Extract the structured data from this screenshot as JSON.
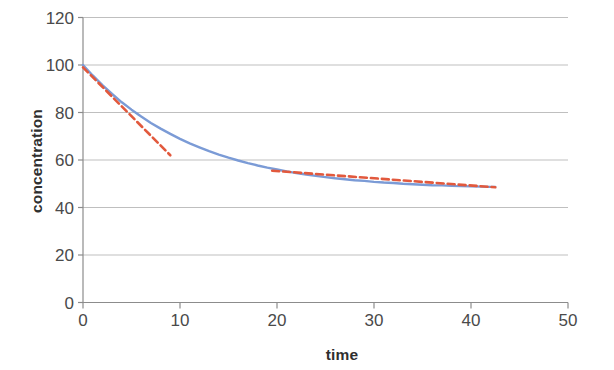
{
  "chart_data": {
    "type": "line",
    "title": "",
    "subtitle": "",
    "xlabel": "time",
    "ylabel": "concentration",
    "xlim": [
      0,
      50
    ],
    "ylim": [
      0,
      120
    ],
    "xticks": [
      0,
      10,
      20,
      30,
      40,
      50
    ],
    "yticks": [
      0,
      20,
      40,
      60,
      80,
      100,
      120
    ],
    "grid": "horizontal",
    "legend": "none",
    "colors": {
      "series_blue": "#7b9bd6",
      "series_red": "#e2593d",
      "gridline": "#bfbfbf",
      "axis": "#8c8c8c",
      "text": "#404040"
    },
    "series": [
      {
        "name": "concentration",
        "style": "solid",
        "color": "#7b9bd6",
        "x": [
          0,
          1,
          2,
          3,
          4,
          5,
          6,
          7,
          8,
          9,
          10,
          11,
          12,
          13,
          14,
          15,
          16,
          17,
          18,
          19,
          20,
          21,
          22,
          23,
          24,
          25,
          26,
          27,
          28,
          29,
          30,
          31,
          32,
          33,
          34,
          35,
          36,
          37,
          38,
          39,
          40,
          41,
          42,
          42.5
        ],
        "y": [
          100.0,
          95.6,
          91.5,
          87.8,
          84.3,
          81.2,
          78.3,
          75.6,
          73.2,
          71.0,
          68.9,
          67.0,
          65.3,
          63.7,
          62.3,
          61.0,
          59.8,
          58.7,
          57.7,
          56.8,
          56.0,
          55.2,
          54.5,
          53.9,
          53.3,
          52.8,
          52.3,
          51.9,
          51.5,
          51.2,
          50.8,
          50.5,
          50.3,
          50.0,
          49.8,
          49.6,
          49.4,
          49.3,
          49.1,
          49.0,
          48.9,
          48.8,
          48.7,
          48.7
        ]
      },
      {
        "name": "initial rate tangent",
        "style": "dashed",
        "color": "#e2593d",
        "x": [
          0,
          9
        ],
        "y": [
          99.0,
          62.0
        ]
      },
      {
        "name": "late phase fit",
        "style": "dashed",
        "color": "#e2593d",
        "x": [
          19.5,
          42.5
        ],
        "y": [
          55.5,
          48.5
        ]
      }
    ]
  },
  "axes": {
    "y_tick_labels": [
      "120",
      "100",
      "80",
      "60",
      "40",
      "20",
      "0"
    ],
    "x_tick_labels": [
      "0",
      "10",
      "20",
      "30",
      "40",
      "50"
    ],
    "y_title": "concentration",
    "x_title": "time"
  }
}
